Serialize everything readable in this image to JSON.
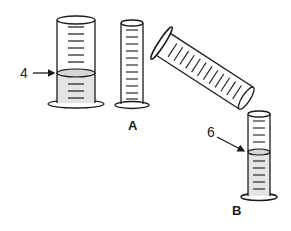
{
  "diagram": {
    "title": "",
    "colors": {
      "stroke": "#1a1a1a",
      "liquid": "#e4e4e4",
      "liquid_surface": "#d6d6d6",
      "background": "#ffffff"
    },
    "groups": [
      {
        "id": "A",
        "label": "A",
        "items": [
          {
            "name": "graduated-cylinder-with-liquid",
            "liquid_level_label": "4"
          },
          {
            "name": "graduated-cylinder-empty"
          }
        ]
      },
      {
        "id": "pour",
        "label": "",
        "items": [
          {
            "name": "graduated-cylinder-tilted"
          }
        ]
      },
      {
        "id": "B",
        "label": "B",
        "items": [
          {
            "name": "graduated-cylinder-narrow-with-liquid",
            "liquid_level_label": "6"
          }
        ]
      }
    ],
    "annotations": {
      "level_a": "4",
      "level_b": "6",
      "label_a": "A",
      "label_b": "B"
    }
  }
}
